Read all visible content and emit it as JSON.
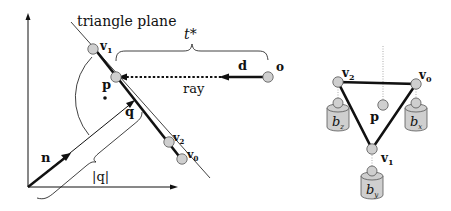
{
  "left_diagram": {
    "plane_label": "triangle plane",
    "t_label": "t*",
    "ray_label": "ray",
    "direction_label": "d",
    "origin_label": "o",
    "point_label": "p",
    "normal_label": "n",
    "q_label": "q",
    "q_magnitude_label": "|q|",
    "vertices": [
      {
        "name": "v",
        "sub": "1"
      },
      {
        "name": "v",
        "sub": "2"
      },
      {
        "name": "v",
        "sub": "0"
      }
    ]
  },
  "right_diagram": {
    "point_label": "p",
    "vertices": [
      {
        "name": "v",
        "sub": "2"
      },
      {
        "name": "v",
        "sub": "0"
      },
      {
        "name": "v",
        "sub": "1"
      }
    ],
    "weights": [
      {
        "name": "b",
        "sub": "z"
      },
      {
        "name": "b",
        "sub": "x"
      },
      {
        "name": "b",
        "sub": "y"
      }
    ]
  },
  "colors": {
    "stroke": "#111111",
    "vertex_fill": "#cfcfcf",
    "weight_fill": "#cfcfcf"
  }
}
